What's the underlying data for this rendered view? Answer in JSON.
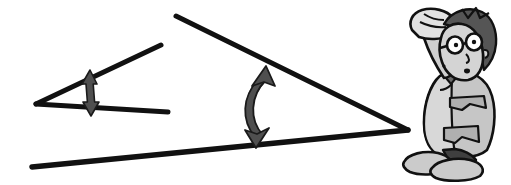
{
  "illustration": {
    "title": "Two angles compared with double-headed arrows and a puzzled person",
    "background_color": "#ffffff",
    "ink_color": "#111111",
    "arrow_color": "#4a4a4a",
    "skin_color": "#d9d9d9",
    "jacket_color": "#c9c9c9",
    "hair_color": "#6e6e6e",
    "shoe_color": "#bdbdbd",
    "dark_shade": "#575757"
  },
  "figures": {
    "small_angle": {
      "name": "small-angle",
      "vertex": {
        "x": 36,
        "y": 104
      },
      "upper_ray_end": {
        "x": 161,
        "y": 45
      },
      "lower_ray_end": {
        "x": 168,
        "y": 112
      },
      "stroke_width": 5
    },
    "large_angle": {
      "name": "large-angle",
      "vertex": {
        "x": 408,
        "y": 130
      },
      "upper_ray_end": {
        "x": 176,
        "y": 16
      },
      "lower_ray_end": {
        "x": 32,
        "y": 167
      },
      "stroke_width": 5
    },
    "small_arrow": {
      "name": "small-double-arrow",
      "top": {
        "x": 90,
        "y": 73
      },
      "bottom": {
        "x": 92,
        "y": 113
      },
      "shaft_width": 5,
      "head_width": 14
    },
    "large_arrow": {
      "name": "large-double-arrow",
      "top": {
        "x": 262,
        "y": 70
      },
      "bottom": {
        "x": 258,
        "y": 143
      },
      "bulge": {
        "x": 243,
        "y": 106
      },
      "shaft_width": 7,
      "head_width": 20
    },
    "person": {
      "name": "puzzled-person",
      "pose": "hand-scratching-head",
      "has_glasses": true,
      "bounds": {
        "x": 395,
        "y": 8,
        "width": 110,
        "height": 177
      }
    }
  },
  "labels": {
    "alt_text": "A small narrow angle on the left and a wider angle on the right, each spanned by a double-headed arrow, with a confused person scratching his head."
  }
}
